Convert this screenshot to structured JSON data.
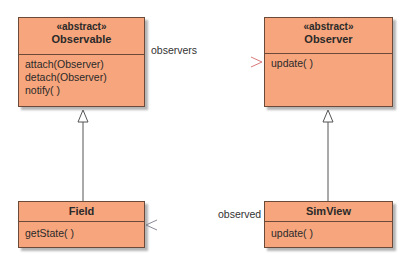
{
  "diagram": {
    "type": "UML class diagram",
    "colors": {
      "class_fill": "#f7a57c",
      "class_border": "#6b4a3a",
      "line": "#555555",
      "dashed_line_start": "#5a6a8a",
      "dashed_line_end": "#d87a7a"
    },
    "classes": [
      {
        "id": "observable",
        "stereotype": "«abstract»",
        "name": "Observable",
        "methods": [
          "attach(Observer)",
          "detach(Observer)",
          "notify( )"
        ]
      },
      {
        "id": "observer",
        "stereotype": "«abstract»",
        "name": "Observer",
        "methods": [
          "update( )"
        ]
      },
      {
        "id": "field",
        "stereotype": "",
        "name": "Field",
        "methods": [
          "getState( )"
        ]
      },
      {
        "id": "simview",
        "stereotype": "",
        "name": "SimView",
        "methods": [
          "update( )"
        ]
      }
    ],
    "relationships": [
      {
        "from": "Observable",
        "to": "Observer",
        "kind": "dependency",
        "label": "observers"
      },
      {
        "from": "SimView",
        "to": "Field",
        "kind": "dependency",
        "label": "observed"
      },
      {
        "from": "Field",
        "to": "Observable",
        "kind": "generalization",
        "label": ""
      },
      {
        "from": "SimView",
        "to": "Observer",
        "kind": "generalization",
        "label": ""
      }
    ]
  }
}
